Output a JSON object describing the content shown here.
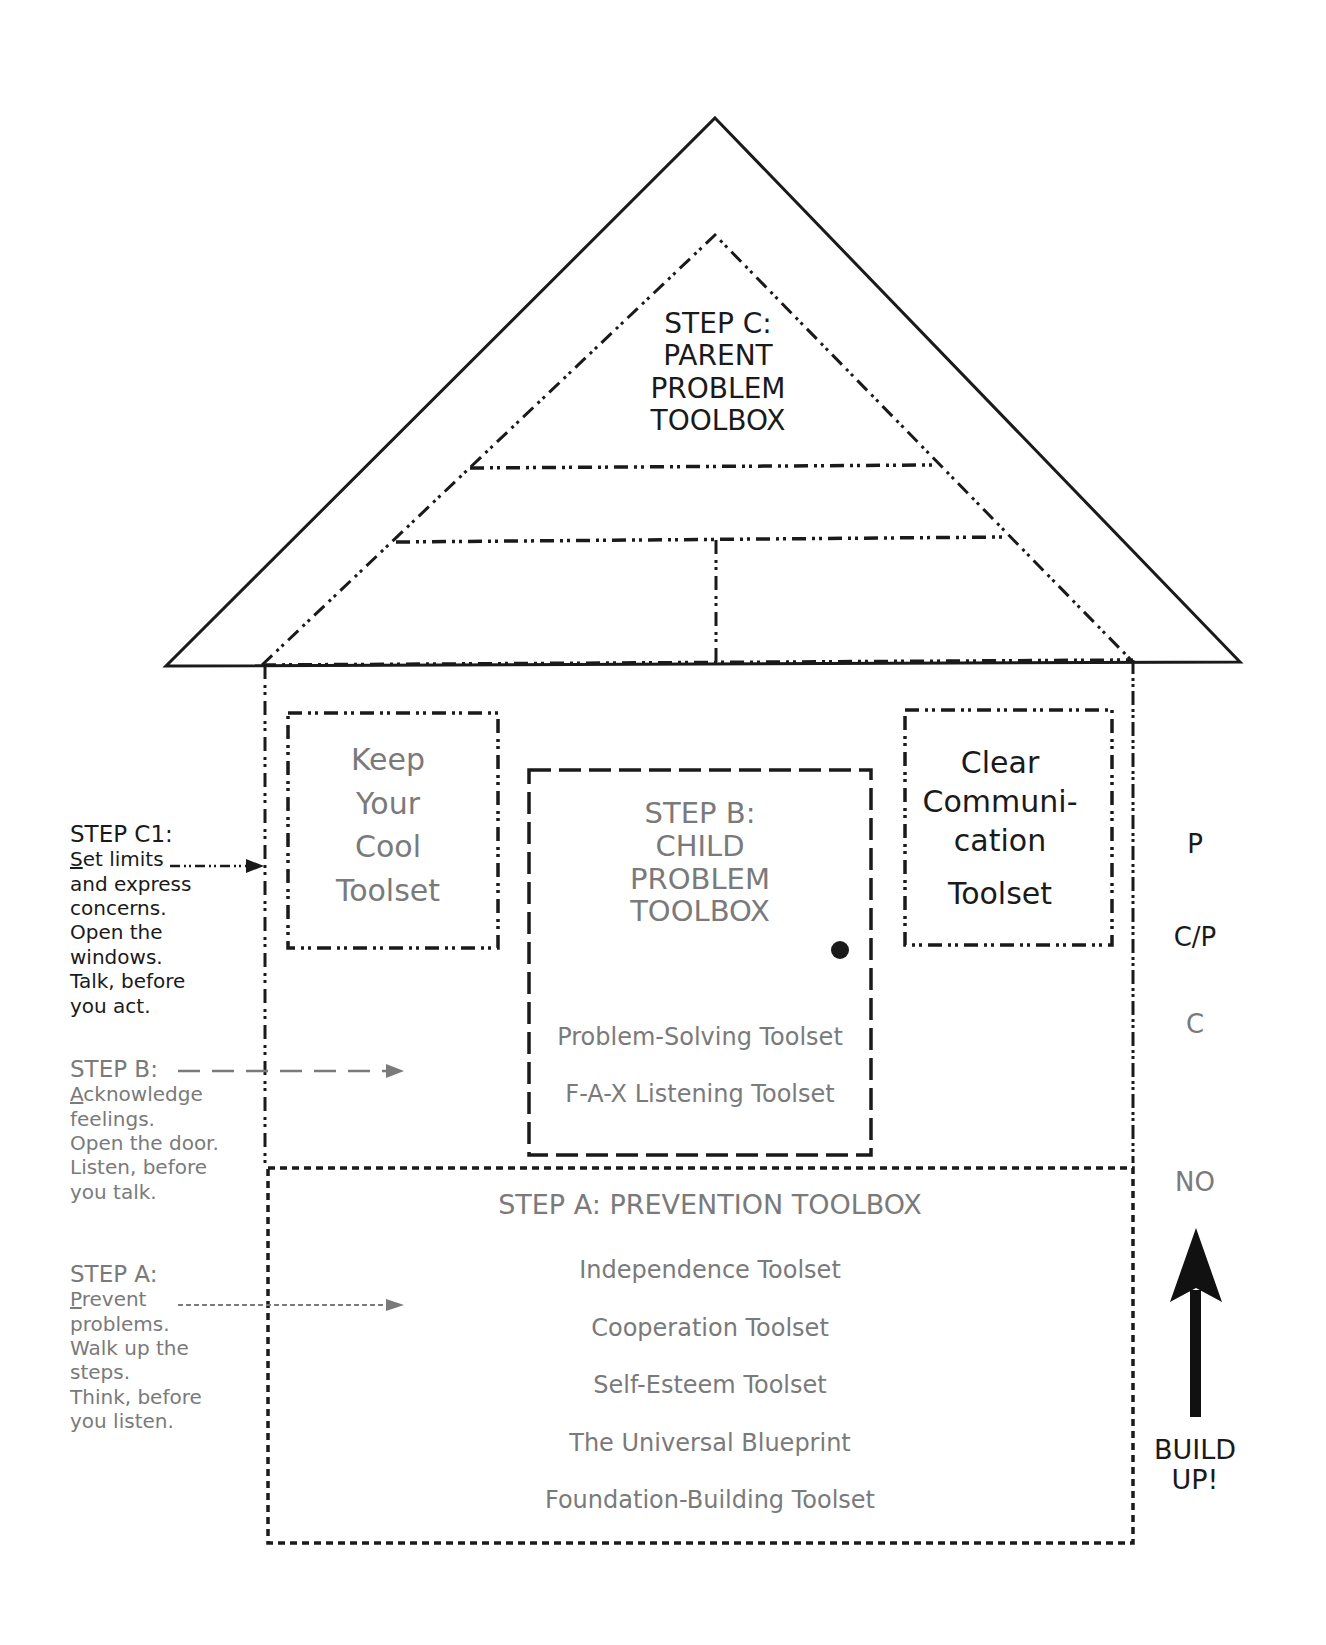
{
  "roof": {
    "title_lines": [
      "STEP C:",
      "PARENT",
      "PROBLEM",
      "TOOLBOX"
    ]
  },
  "windows": {
    "left": {
      "lines": [
        "Keep",
        "Your",
        "Cool",
        "Toolset"
      ]
    },
    "right": {
      "lines": [
        "Clear",
        "Communi-",
        "cation",
        "Toolset"
      ]
    }
  },
  "door": {
    "title_lines": [
      "STEP B:",
      "CHILD",
      "PROBLEM",
      "TOOLBOX"
    ],
    "items": [
      "Problem-Solving Toolset",
      "F-A-X Listening Toolset"
    ]
  },
  "foundation": {
    "title": "STEP A: PREVENTION TOOLBOX",
    "items": [
      "Independence Toolset",
      "Cooperation Toolset",
      "Self-Esteem Toolset",
      "The Universal Blueprint",
      "Foundation-Building Toolset"
    ]
  },
  "side_notes": {
    "step_c1": {
      "heading": "STEP C1:",
      "first_letter": "S",
      "first_rest": "et limits",
      "lines": [
        "and express",
        "concerns.",
        "Open the",
        "windows.",
        "Talk, before",
        "you act."
      ]
    },
    "step_b": {
      "heading": "STEP B:",
      "first_letter": "A",
      "first_rest": "cknowledge",
      "lines": [
        "feelings.",
        "Open the door.",
        "Listen, before",
        "you talk."
      ]
    },
    "step_a": {
      "heading": "STEP A:",
      "first_letter": "P",
      "first_rest": "revent",
      "lines": [
        "problems.",
        "Walk up the",
        "steps.",
        "Think, before",
        "you listen."
      ]
    }
  },
  "scale": {
    "labels": [
      "P",
      "C/P",
      "C",
      "NO"
    ],
    "arrow_label_lines": [
      "BUILD",
      "UP!"
    ]
  },
  "colors": {
    "primary_ink": "#1a1a1a",
    "secondary_ink": "#7a7a7a",
    "background": "#ffffff"
  }
}
